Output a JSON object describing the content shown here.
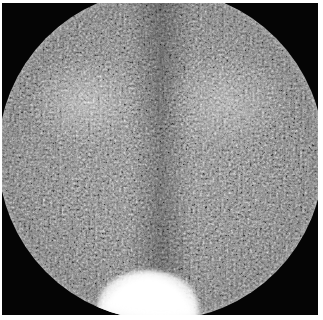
{
  "image": {
    "type": "scintigraphy",
    "description": "Grayscale circular gamma-camera field of view with noisy uptake pattern",
    "regions": [
      {
        "name": "upper-left-uptake",
        "intensity": "moderate-high"
      },
      {
        "name": "upper-right-uptake",
        "intensity": "moderate-high"
      },
      {
        "name": "midline",
        "intensity": "lower"
      },
      {
        "name": "bottom-center-hotspot",
        "intensity": "saturated"
      }
    ],
    "colors": {
      "background": "#050505",
      "field": "#7a7a7a",
      "hotspot": "#ffffff",
      "page": "#ffffff"
    }
  }
}
